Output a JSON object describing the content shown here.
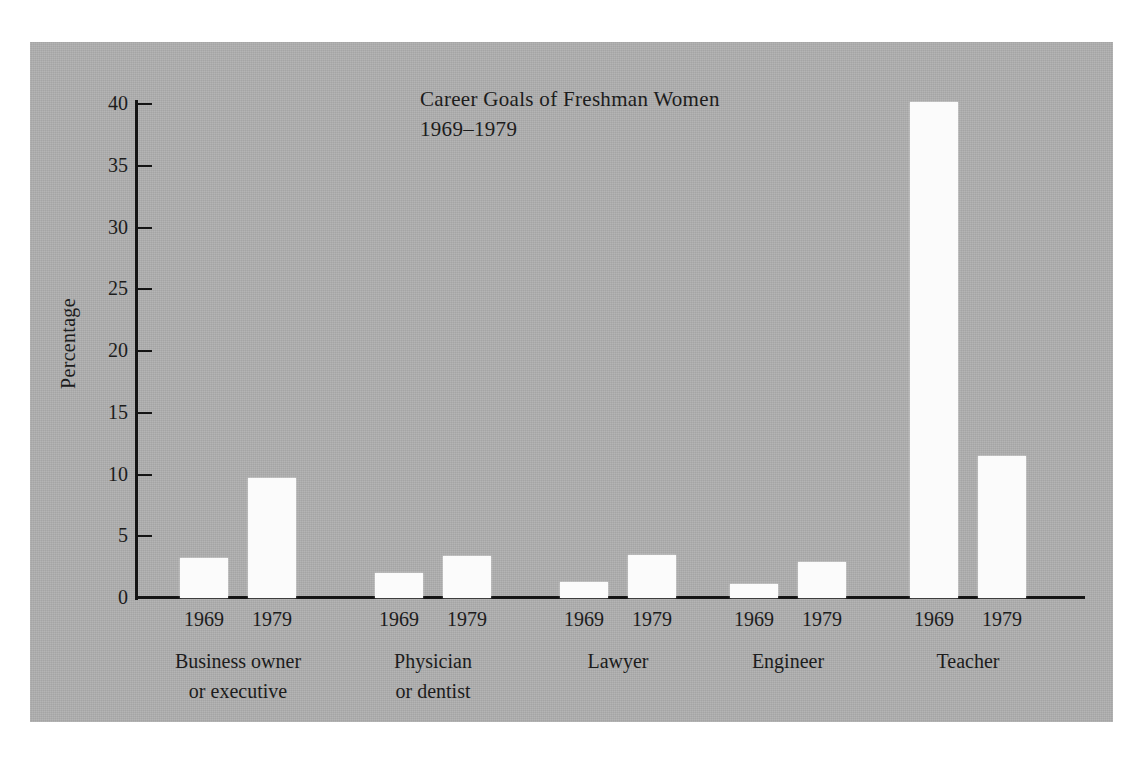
{
  "figure": {
    "background_color": "#b0b0b0",
    "page_color": "#ffffff",
    "bar_color": "#fbfbfb",
    "axis_color": "#151515"
  },
  "chart_data": {
    "type": "bar",
    "title": "Career Goals of Freshman Women",
    "subtitle": "1969–1979",
    "xlabel": "",
    "ylabel": "Percentage",
    "ylim": [
      0,
      41.5
    ],
    "yticks": [
      0,
      5,
      10,
      15,
      20,
      25,
      30,
      35,
      40
    ],
    "ytick_labels": [
      "0",
      "5",
      "10",
      "15",
      "20",
      "25",
      "30",
      "35",
      "40"
    ],
    "grid": false,
    "legend": "none",
    "categories": [
      "Business owner or executive",
      "Physician or dentist",
      "Lawyer",
      "Engineer",
      "Teacher"
    ],
    "category_label_lines": [
      [
        "Business owner",
        "or executive"
      ],
      [
        "Physician",
        "or dentist"
      ],
      [
        "Lawyer"
      ],
      [
        "Engineer"
      ],
      [
        "Teacher"
      ]
    ],
    "series": [
      {
        "name": "1969",
        "values": [
          3.2,
          2.0,
          1.3,
          1.1,
          40.2
        ]
      },
      {
        "name": "1979",
        "values": [
          9.7,
          3.4,
          3.5,
          2.9,
          11.5
        ]
      }
    ]
  },
  "axis": {
    "tick_labels": [
      "0",
      "5",
      "10",
      "15",
      "20",
      "25",
      "30",
      "35",
      "40"
    ],
    "y_title": "Percentage"
  },
  "series_labels": [
    "1969",
    "1979",
    "1969",
    "1979",
    "1969",
    "1979",
    "1969",
    "1979",
    "1969",
    "1979"
  ]
}
